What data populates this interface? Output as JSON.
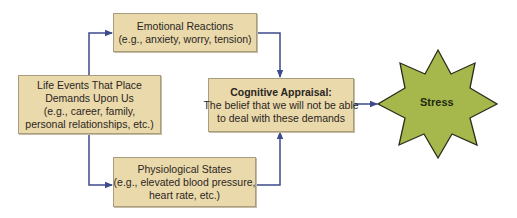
{
  "diagram": {
    "colors": {
      "box_fill": "#ead9ab",
      "box_border": "#a89c82",
      "arrow": "#3d4a8c",
      "star_fill": "#a6b84c",
      "star_outline": "#2c2c1c"
    },
    "nodes": {
      "life_events": {
        "line1": "Life Events That Place",
        "line2": "Demands Upon Us",
        "line3": "(e.g., career, family,",
        "line4": "personal relationships, etc.)"
      },
      "emotional": {
        "line1": "Emotional Reactions",
        "line2": "(e.g., anxiety, worry, tension)"
      },
      "physiological": {
        "line1": "Physiological States",
        "line2": "(e.g., elevated blood pressure,",
        "line3": "heart rate, etc.)"
      },
      "cognitive": {
        "title": "Cognitive Appraisal:",
        "line1": "The belief that we will not be able",
        "line2": "to deal with these demands"
      },
      "stress": {
        "label": "Stress"
      }
    },
    "edges": [
      {
        "from": "life_events",
        "to": "emotional"
      },
      {
        "from": "life_events",
        "to": "physiological"
      },
      {
        "from": "emotional",
        "to": "cognitive"
      },
      {
        "from": "physiological",
        "to": "cognitive"
      },
      {
        "from": "cognitive",
        "to": "stress"
      }
    ]
  }
}
